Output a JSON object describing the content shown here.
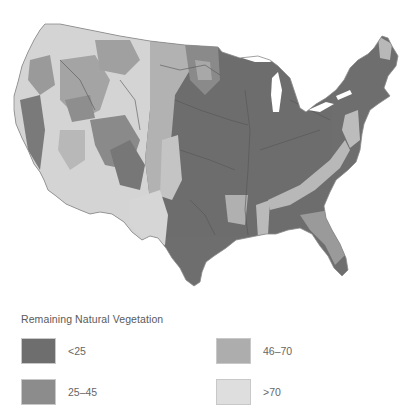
{
  "map": {
    "subject": "Contiguous United States",
    "description": "Remaining natural vegetation by region, grayscale choropleth"
  },
  "legend": {
    "title": "Remaining Natural Vegetation",
    "items": [
      {
        "label": "<25",
        "color": "#6e6e6e"
      },
      {
        "label": "25–45",
        "color": "#8c8c8c"
      },
      {
        "label": "46–70",
        "color": "#adadad"
      },
      {
        "label": ">70",
        "color": "#dedede"
      }
    ]
  },
  "colors": {
    "lt25": "#6e6e6e",
    "c25_45": "#8c8c8c",
    "c46_70": "#adadad",
    "gt70": "#dedede",
    "boundary": "#555555",
    "background": "#ffffff"
  }
}
